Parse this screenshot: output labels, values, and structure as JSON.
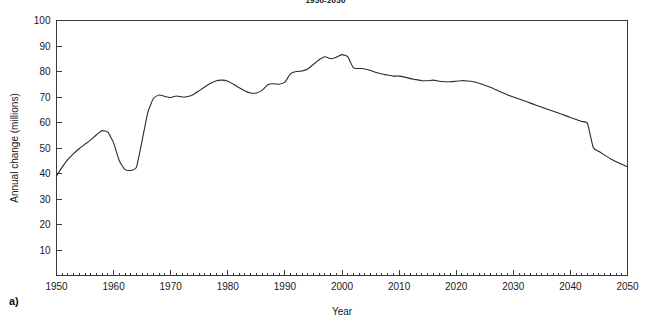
{
  "figure": {
    "panel_label": "a)",
    "title": "1950-2050"
  },
  "chart_data": {
    "type": "line",
    "title": "1950-2050",
    "xlabel": "Year",
    "ylabel": "Annual change (millions)",
    "xlim": [
      1950,
      2050
    ],
    "ylim": [
      0,
      100
    ],
    "xticks": [
      1950,
      1960,
      1970,
      1980,
      1990,
      2000,
      2010,
      2020,
      2030,
      2040,
      2050
    ],
    "xtick_labels": [
      "1950",
      "1960",
      "1970",
      "1980",
      "1990",
      "2000",
      "2010",
      "2020",
      "2030",
      "2040",
      "2050"
    ],
    "x_minor_tick_step": 1,
    "yticks": [
      10,
      20,
      30,
      40,
      50,
      60,
      70,
      80,
      90,
      100
    ],
    "ytick_labels": [
      "10",
      "20",
      "30",
      "40",
      "50",
      "60",
      "70",
      "80",
      "90",
      "100"
    ],
    "grid": false,
    "legend": false,
    "line_color": "#2b2b2b",
    "series": [
      {
        "name": "Annual population change",
        "x": [
          1950,
          1951,
          1952,
          1953,
          1954,
          1955,
          1956,
          1957,
          1958,
          1959,
          1960,
          1961,
          1962,
          1963,
          1964,
          1965,
          1966,
          1967,
          1968,
          1969,
          1970,
          1971,
          1972,
          1973,
          1974,
          1975,
          1976,
          1977,
          1978,
          1979,
          1980,
          1981,
          1982,
          1983,
          1984,
          1985,
          1986,
          1987,
          1988,
          1989,
          1990,
          1991,
          1992,
          1993,
          1994,
          1995,
          1996,
          1997,
          1998,
          1999,
          2000,
          2001,
          2002,
          2003,
          2004,
          2005,
          2006,
          2007,
          2008,
          2009,
          2010,
          2011,
          2012,
          2013,
          2014,
          2015,
          2016,
          2017,
          2018,
          2019,
          2020,
          2021,
          2022,
          2023,
          2024,
          2025,
          2026,
          2027,
          2028,
          2029,
          2030,
          2031,
          2032,
          2033,
          2034,
          2035,
          2036,
          2037,
          2038,
          2039,
          2040,
          2041,
          2042,
          2043,
          2044,
          2045,
          2046,
          2047,
          2048,
          2049,
          2050
        ],
        "values": [
          39.0,
          42.5,
          45.5,
          47.8,
          49.8,
          51.5,
          53.2,
          55.2,
          56.8,
          56.2,
          52.0,
          45.0,
          41.5,
          41.2,
          42.5,
          53.0,
          64.0,
          69.5,
          70.8,
          70.2,
          69.8,
          70.4,
          70.0,
          70.2,
          71.0,
          72.5,
          74.0,
          75.4,
          76.4,
          76.6,
          76.2,
          75.0,
          73.6,
          72.4,
          71.6,
          71.6,
          72.6,
          74.8,
          75.2,
          75.0,
          75.8,
          79.2,
          80.0,
          80.2,
          81.0,
          82.8,
          84.6,
          85.8,
          85.0,
          85.6,
          86.6,
          85.8,
          81.4,
          81.2,
          81.0,
          80.4,
          79.6,
          79.0,
          78.6,
          78.2,
          78.2,
          77.8,
          77.2,
          76.8,
          76.4,
          76.4,
          76.6,
          76.2,
          76.0,
          76.0,
          76.2,
          76.4,
          76.3,
          76.0,
          75.4,
          74.6,
          73.8,
          72.8,
          71.8,
          70.8,
          70.0,
          69.2,
          68.4,
          67.6,
          66.8,
          66.0,
          65.2,
          64.4,
          63.6,
          62.8,
          62.0,
          61.2,
          60.4,
          59.6,
          59.0,
          58.6,
          58.2,
          56.6,
          55.0,
          53.4,
          51.8
        ],
        "values_tail": [
          50.2,
          48.6,
          47.2,
          45.8,
          44.6,
          43.6,
          42.6
        ]
      }
    ]
  },
  "axes": {
    "y_axis_title": "Annual change (millions)",
    "x_axis_title": "Year"
  }
}
